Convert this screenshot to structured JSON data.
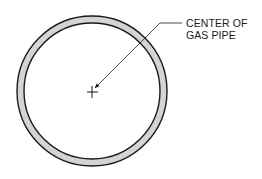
{
  "diagram": {
    "label": {
      "line1": "CENTER OF",
      "line2": "GAS PIPE"
    },
    "pipe": {
      "center": [
        92,
        91
      ],
      "outer_radius": 75,
      "inner_radius": 68,
      "wall_fill": "#d4d4d4",
      "stroke": "#1a1a1a"
    },
    "center_mark": "plus-crosshair",
    "leader": {
      "points": [
        [
          182,
          23
        ],
        [
          160,
          23
        ],
        [
          95,
          88
        ]
      ],
      "arrowhead": "at-center"
    }
  }
}
